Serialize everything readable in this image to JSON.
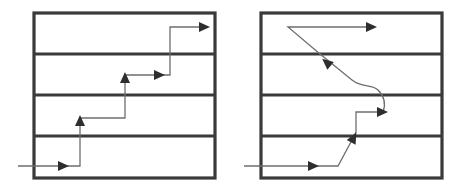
{
  "colors": {
    "frame": "#3a3a3a",
    "path": "#6e6e6e",
    "arrowhead": "#2e2e2e",
    "background": "#ffffff"
  },
  "diagrams": [
    {
      "name": "staircase-progression",
      "box": {
        "x": 34,
        "y": 13,
        "w": 181,
        "h": 165
      },
      "dividers_y": [
        54,
        95,
        136
      ],
      "path_points": [
        [
          18,
          166
        ],
        [
          80,
          166
        ],
        [
          80,
          118
        ],
        [
          125,
          118
        ],
        [
          125,
          75
        ],
        [
          170,
          75
        ],
        [
          170,
          27
        ],
        [
          205,
          27
        ]
      ],
      "arrowheads": [
        {
          "x": 64,
          "y": 166,
          "dir": "right"
        },
        {
          "x": 80,
          "y": 120,
          "dir": "up"
        },
        {
          "x": 125,
          "y": 77,
          "dir": "up"
        },
        {
          "x": 160,
          "y": 75,
          "dir": "right"
        },
        {
          "x": 205,
          "y": 27,
          "dir": "right"
        }
      ]
    },
    {
      "name": "nonlinear-progression",
      "box": {
        "x": 261,
        "y": 13,
        "w": 181,
        "h": 165
      },
      "dividers_y": [
        54,
        95,
        136
      ],
      "path_d": "M 244 166 L 338 166 L 352 140 L 356 132 L 356 112 L 383 112 C 386 104, 384 96, 378 90 C 372 84, 362 88, 352 80 L 320 54 L 288 27 L 372 27",
      "arrowheads": [
        {
          "x": 314,
          "y": 166,
          "dir": "right"
        },
        {
          "x": 354,
          "y": 137,
          "angle": -62
        },
        {
          "x": 383,
          "y": 112,
          "dir": "right"
        },
        {
          "x": 326,
          "y": 62,
          "angle": -140
        },
        {
          "x": 372,
          "y": 27,
          "dir": "right"
        }
      ]
    }
  ]
}
